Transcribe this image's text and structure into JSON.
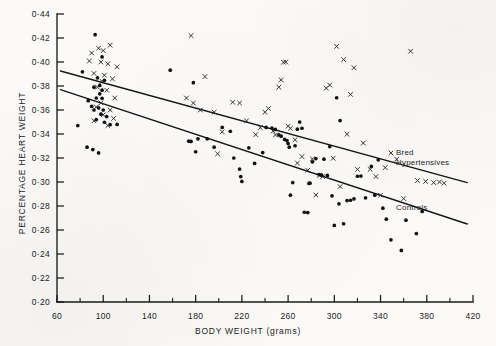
{
  "figure": {
    "background_color": "#fbfaf8",
    "ink_color": "#1a1a1a"
  },
  "axes": {
    "x_title": "BODY WEIGHT (grams)",
    "y_title": "PERCENTAGE HEART WEIGHT",
    "x_tick_labels": [
      "60",
      "100",
      "140",
      "180",
      "220",
      "260",
      "300",
      "340",
      "380",
      "420"
    ],
    "y_tick_labels": [
      "0·44",
      "0·42",
      "0·40",
      "0·38",
      "0·36",
      "0·34",
      "0·32",
      "0·30",
      "0·28",
      "0·26",
      "0·24",
      "0·22",
      "0·20"
    ]
  },
  "series_labels": {
    "hypertensives_line1": "Bred",
    "hypertensives_line2": "Hypertensives",
    "controls": "Controls"
  },
  "chart_data": {
    "type": "scatter",
    "title": "",
    "xlabel": "BODY WEIGHT (grams)",
    "ylabel": "PERCENTAGE HEART WEIGHT",
    "xlim": [
      60,
      420
    ],
    "ylim": [
      0.2,
      0.44
    ],
    "x_major_ticks": [
      60,
      100,
      140,
      180,
      220,
      260,
      300,
      340,
      380,
      420
    ],
    "x_minor_ticks": [
      80,
      120,
      160,
      200,
      240,
      280,
      320,
      360,
      400
    ],
    "y_ticks": [
      0.2,
      0.22,
      0.24,
      0.26,
      0.28,
      0.3,
      0.32,
      0.34,
      0.36,
      0.38,
      0.4,
      0.42,
      0.44
    ],
    "grid": false,
    "legend_position": "right-inline-annotation",
    "series": [
      {
        "name": "Bred Hypertensives",
        "marker": "x",
        "regression_line": {
          "x": [
            63,
            415
          ],
          "y": [
            0.3925,
            0.2995
          ]
        },
        "points": [
          [
            90,
            0.4075
          ],
          [
            96,
            0.4115
          ],
          [
            100,
            0.4095
          ],
          [
            106,
            0.414
          ],
          [
            88,
            0.4008
          ],
          [
            98,
            0.4
          ],
          [
            104,
            0.3985
          ],
          [
            112,
            0.396
          ],
          [
            92,
            0.3905
          ],
          [
            101,
            0.389
          ],
          [
            99,
            0.3838
          ],
          [
            108,
            0.386
          ],
          [
            95,
            0.379
          ],
          [
            103,
            0.3765
          ],
          [
            110,
            0.37
          ],
          [
            98,
            0.366
          ],
          [
            94,
            0.3625
          ],
          [
            106,
            0.36
          ],
          [
            100,
            0.356
          ],
          [
            109,
            0.353
          ],
          [
            92,
            0.351
          ],
          [
            104,
            0.347
          ],
          [
            176,
            0.422
          ],
          [
            188,
            0.3878
          ],
          [
            178,
            0.3658
          ],
          [
            184,
            0.36
          ],
          [
            172,
            0.37
          ],
          [
            196,
            0.3582
          ],
          [
            203,
            0.3418
          ],
          [
            199,
            0.3235
          ],
          [
            212,
            0.3665
          ],
          [
            218,
            0.3658
          ],
          [
            224,
            0.351
          ],
          [
            232,
            0.3395
          ],
          [
            236,
            0.3452
          ],
          [
            240,
            0.3582
          ],
          [
            243,
            0.3612
          ],
          [
            247,
            0.3425
          ],
          [
            249,
            0.3392
          ],
          [
            252,
            0.379
          ],
          [
            254,
            0.385
          ],
          [
            256,
            0.3998
          ],
          [
            258,
            0.4
          ],
          [
            260,
            0.3465
          ],
          [
            262,
            0.3448
          ],
          [
            266,
            0.3352
          ],
          [
            268,
            0.3158
          ],
          [
            272,
            0.3212
          ],
          [
            277,
            0.3098
          ],
          [
            281,
            0.3192
          ],
          [
            284,
            0.2892
          ],
          [
            287,
            0.3055
          ],
          [
            290,
            0.3045
          ],
          [
            293,
            0.3782
          ],
          [
            296,
            0.3808
          ],
          [
            299,
            0.3198
          ],
          [
            302,
            0.413
          ],
          [
            305,
            0.2962
          ],
          [
            308,
            0.402
          ],
          [
            311,
            0.3398
          ],
          [
            314,
            0.373
          ],
          [
            317,
            0.3952
          ],
          [
            320,
            0.3105
          ],
          [
            325,
            0.3325
          ],
          [
            331,
            0.3105
          ],
          [
            336,
            0.3045
          ],
          [
            340,
            0.289
          ],
          [
            344,
            0.312
          ],
          [
            349,
            0.3242
          ],
          [
            354,
            0.319
          ],
          [
            360,
            0.2862
          ],
          [
            366,
            0.409
          ],
          [
            372,
            0.3012
          ],
          [
            379,
            0.3005
          ],
          [
            386,
            0.2995
          ],
          [
            391,
            0.3
          ],
          [
            395,
            0.299
          ]
        ]
      },
      {
        "name": "Controls",
        "marker": "o",
        "regression_line": {
          "x": [
            63,
            415
          ],
          "y": [
            0.377,
            0.265
          ]
        },
        "points": [
          [
            93,
            0.4228
          ],
          [
            99,
            0.4042
          ],
          [
            95,
            0.3868
          ],
          [
            101,
            0.3848
          ],
          [
            82,
            0.3918
          ],
          [
            97,
            0.3805
          ],
          [
            92,
            0.379
          ],
          [
            99,
            0.3765
          ],
          [
            97,
            0.3735
          ],
          [
            87,
            0.3678
          ],
          [
            94,
            0.37
          ],
          [
            99,
            0.3698
          ],
          [
            90,
            0.363
          ],
          [
            96,
            0.3618
          ],
          [
            100,
            0.36
          ],
          [
            92,
            0.36
          ],
          [
            98,
            0.3565
          ],
          [
            103,
            0.3545
          ],
          [
            94,
            0.352
          ],
          [
            101,
            0.3498
          ],
          [
            106,
            0.3478
          ],
          [
            112,
            0.348
          ],
          [
            78,
            0.347
          ],
          [
            86,
            0.329
          ],
          [
            91,
            0.327
          ],
          [
            96,
            0.3242
          ],
          [
            158,
            0.3932
          ],
          [
            178,
            0.3828
          ],
          [
            174,
            0.334
          ],
          [
            176,
            0.3338
          ],
          [
            182,
            0.336
          ],
          [
            180,
            0.3252
          ],
          [
            190,
            0.336
          ],
          [
            196,
            0.329
          ],
          [
            203,
            0.3455
          ],
          [
            210,
            0.3422
          ],
          [
            213,
            0.32
          ],
          [
            218,
            0.3108
          ],
          [
            219,
            0.3045
          ],
          [
            220,
            0.3005
          ],
          [
            226,
            0.3285
          ],
          [
            231,
            0.3155
          ],
          [
            238,
            0.3245
          ],
          [
            241,
            0.3455
          ],
          [
            246,
            0.345
          ],
          [
            249,
            0.3438
          ],
          [
            252,
            0.3392
          ],
          [
            254,
            0.3382
          ],
          [
            257,
            0.3355
          ],
          [
            259,
            0.3345
          ],
          [
            260,
            0.332
          ],
          [
            261,
            0.329
          ],
          [
            262,
            0.289
          ],
          [
            264,
            0.2995
          ],
          [
            266,
            0.3302
          ],
          [
            268,
            0.344
          ],
          [
            270,
            0.35
          ],
          [
            272,
            0.3448
          ],
          [
            274,
            0.2748
          ],
          [
            277,
            0.2745
          ],
          [
            278,
            0.2988
          ],
          [
            279,
            0.299
          ],
          [
            281,
            0.3168
          ],
          [
            284,
            0.3195
          ],
          [
            287,
            0.3062
          ],
          [
            289,
            0.3058
          ],
          [
            291,
            0.319
          ],
          [
            294,
            0.3055
          ],
          [
            296,
            0.3295
          ],
          [
            298,
            0.2885
          ],
          [
            300,
            0.2638
          ],
          [
            302,
            0.3702
          ],
          [
            304,
            0.2818
          ],
          [
            305,
            0.3512
          ],
          [
            308,
            0.2652
          ],
          [
            311,
            0.2845
          ],
          [
            314,
            0.2848
          ],
          [
            317,
            0.286
          ],
          [
            320,
            0.3048
          ],
          [
            323,
            0.305
          ],
          [
            327,
            0.2868
          ],
          [
            332,
            0.313
          ],
          [
            335,
            0.289
          ],
          [
            338,
            0.3185
          ],
          [
            342,
            0.2782
          ],
          [
            345,
            0.269
          ],
          [
            349,
            0.2518
          ],
          [
            358,
            0.243
          ],
          [
            362,
            0.2682
          ],
          [
            371,
            0.257
          ],
          [
            376,
            0.2755
          ]
        ]
      }
    ]
  }
}
